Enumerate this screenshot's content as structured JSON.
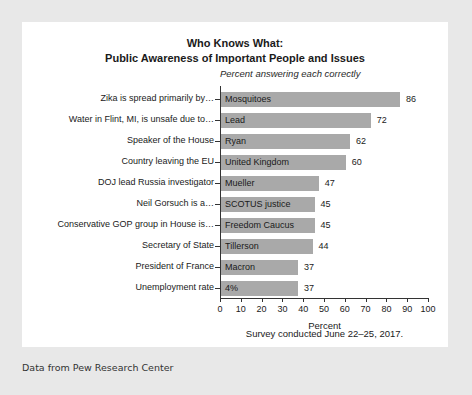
{
  "chart_data": {
    "type": "bar",
    "orientation": "horizontal",
    "title": "Who Knows What:",
    "title_line2": "Public Awareness of Important People and Issues",
    "subtitle": "Percent answering each correctly",
    "xlabel": "Percent",
    "ylabel": "",
    "xlim": [
      0,
      100
    ],
    "xticks": [
      0,
      10,
      20,
      30,
      40,
      50,
      60,
      70,
      80,
      90,
      100
    ],
    "grid": false,
    "legend": false,
    "caption": "Survey conducted June 22–25, 2017.",
    "bar_color": "#a9a9a9",
    "categories": [
      "Zika is spread primarily by…",
      "Water in Flint, MI, is unsafe due to…",
      "Speaker of the House",
      "Country leaving the EU",
      "DOJ lead Russia investigator",
      "Neil Gorsuch is a…",
      "Conservative GOP group in House is…",
      "Secretary of State",
      "President of France",
      "Unemployment rate"
    ],
    "answers": [
      "Mosquitoes",
      "Lead",
      "Ryan",
      "United Kingdom",
      "Mueller",
      "SCOTUS justice",
      "Freedom Caucus",
      "Tillerson",
      "Macron",
      "4%"
    ],
    "values": [
      86,
      72,
      62,
      60,
      47,
      45,
      45,
      44,
      37,
      37
    ]
  },
  "footer": {
    "source": "Data from Pew Research Center"
  }
}
